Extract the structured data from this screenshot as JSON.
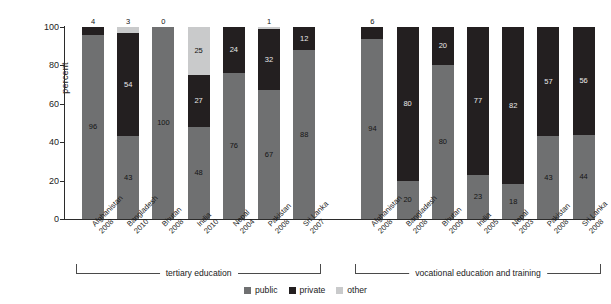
{
  "chart_data": {
    "type": "bar",
    "subtype": "stacked-bar-100-percent",
    "title": "",
    "xlabel": "",
    "ylabel": "percent",
    "ylim": [
      0,
      100
    ],
    "yticks": [
      0,
      20,
      40,
      60,
      80,
      100
    ],
    "grid": false,
    "legend_position": "bottom-center",
    "legend": [
      "public",
      "private",
      "other"
    ],
    "series": [
      {
        "name": "public",
        "color": "#6f7071",
        "values": [
          96,
          43,
          100,
          48,
          76,
          67,
          88,
          94,
          20,
          80,
          23,
          18,
          43,
          44
        ]
      },
      {
        "name": "private",
        "color": "#231f20",
        "values": [
          4,
          54,
          0,
          27,
          24,
          32,
          12,
          6,
          80,
          20,
          77,
          82,
          57,
          56
        ]
      },
      {
        "name": "other",
        "color": "#c9cacb",
        "values": [
          0,
          3,
          0,
          25,
          0,
          1,
          0,
          0,
          0,
          0,
          0,
          0,
          0,
          0
        ]
      }
    ],
    "categories": [
      {
        "country": "Afghanistan",
        "year": "2008",
        "group": "tertiary education"
      },
      {
        "country": "Bangladesh",
        "year": "2010",
        "group": "tertiary education"
      },
      {
        "country": "Bhutan",
        "year": "2008",
        "group": "tertiary education"
      },
      {
        "country": "India",
        "year": "2010",
        "group": "tertiary education"
      },
      {
        "country": "Nepal",
        "year": "2004",
        "group": "tertiary education"
      },
      {
        "country": "Pakistan",
        "year": "2008",
        "group": "tertiary education"
      },
      {
        "country": "Sri Lanka",
        "year": "2007",
        "group": "tertiary education"
      },
      {
        "country": "Afghanistan",
        "year": "2008",
        "group": "vocational education and training"
      },
      {
        "country": "Bangladesh",
        "year": "2008",
        "group": "vocational education and training"
      },
      {
        "country": "Bhutan",
        "year": "2009",
        "group": "vocational education and training"
      },
      {
        "country": "India",
        "year": "2005",
        "group": "vocational education and training"
      },
      {
        "country": "Nepal",
        "year": "2003",
        "group": "vocational education and training"
      },
      {
        "country": "Pakistan",
        "year": "2008",
        "group": "vocational education and training"
      },
      {
        "country": "Sri Lanka",
        "year": "2008",
        "group": "vocational education and training"
      }
    ],
    "groups": [
      {
        "label": "tertiary education",
        "from": 0,
        "to": 6
      },
      {
        "label": "vocational education and training",
        "from": 7,
        "to": 13
      }
    ],
    "bars": [
      {
        "country": "Afghanistan",
        "year": "2008",
        "group": "tertiary education",
        "segments": [
          {
            "series": "public",
            "value": 96,
            "label": "96"
          },
          {
            "series": "private",
            "value": 4,
            "label": "4"
          }
        ]
      },
      {
        "country": "Bangladesh",
        "year": "2010",
        "group": "tertiary education",
        "segments": [
          {
            "series": "public",
            "value": 43,
            "label": "43"
          },
          {
            "series": "private",
            "value": 54,
            "label": "54"
          },
          {
            "series": "other",
            "value": 3,
            "label": "3"
          }
        ]
      },
      {
        "country": "Bhutan",
        "year": "2008",
        "group": "tertiary education",
        "segments": [
          {
            "series": "public",
            "value": 100,
            "label": "100"
          },
          {
            "series": "private",
            "value": 0,
            "label": "0"
          }
        ]
      },
      {
        "country": "India",
        "year": "2010",
        "group": "tertiary education",
        "segments": [
          {
            "series": "public",
            "value": 48,
            "label": "48"
          },
          {
            "series": "private",
            "value": 27,
            "label": "27"
          },
          {
            "series": "other",
            "value": 25,
            "label": "25"
          }
        ]
      },
      {
        "country": "Nepal",
        "year": "2004",
        "group": "tertiary education",
        "segments": [
          {
            "series": "public",
            "value": 76,
            "label": "76"
          },
          {
            "series": "private",
            "value": 24,
            "label": "24"
          }
        ]
      },
      {
        "country": "Pakistan",
        "year": "2008",
        "group": "tertiary education",
        "segments": [
          {
            "series": "public",
            "value": 67,
            "label": "67"
          },
          {
            "series": "private",
            "value": 32,
            "label": "32"
          },
          {
            "series": "other",
            "value": 1,
            "label": "1"
          }
        ]
      },
      {
        "country": "Sri Lanka",
        "year": "2007",
        "group": "tertiary education",
        "segments": [
          {
            "series": "public",
            "value": 88,
            "label": "88"
          },
          {
            "series": "private",
            "value": 12,
            "label": "12"
          }
        ]
      },
      {
        "country": "Afghanistan",
        "year": "2008",
        "group": "vocational education and training",
        "segments": [
          {
            "series": "public",
            "value": 94,
            "label": "94"
          },
          {
            "series": "private",
            "value": 6,
            "label": "6"
          }
        ]
      },
      {
        "country": "Bangladesh",
        "year": "2008",
        "group": "vocational education and training",
        "segments": [
          {
            "series": "public",
            "value": 20,
            "label": "20"
          },
          {
            "series": "private",
            "value": 80,
            "label": "80"
          }
        ]
      },
      {
        "country": "Bhutan",
        "year": "2009",
        "group": "vocational education and training",
        "segments": [
          {
            "series": "public",
            "value": 80,
            "label": "80"
          },
          {
            "series": "private",
            "value": 20,
            "label": "20"
          }
        ]
      },
      {
        "country": "India",
        "year": "2005",
        "group": "vocational education and training",
        "segments": [
          {
            "series": "public",
            "value": 23,
            "label": "23"
          },
          {
            "series": "private",
            "value": 77,
            "label": "77"
          }
        ]
      },
      {
        "country": "Nepal",
        "year": "2003",
        "group": "vocational education and training",
        "segments": [
          {
            "series": "public",
            "value": 18,
            "label": "18"
          },
          {
            "series": "private",
            "value": 82,
            "label": "82"
          }
        ]
      },
      {
        "country": "Pakistan",
        "year": "2008",
        "group": "vocational education and training",
        "segments": [
          {
            "series": "public",
            "value": 43,
            "label": "43"
          },
          {
            "series": "private",
            "value": 57,
            "label": "57"
          }
        ]
      },
      {
        "country": "Sri Lanka",
        "year": "2008",
        "group": "vocational education and training",
        "segments": [
          {
            "series": "public",
            "value": 44,
            "label": "44"
          },
          {
            "series": "private",
            "value": 56,
            "label": "56"
          }
        ]
      }
    ]
  },
  "colors": {
    "public": "#6f7071",
    "private": "#231f20",
    "other": "#c9cacb",
    "axis": "#2b2b2b",
    "background": "#ffffff"
  }
}
